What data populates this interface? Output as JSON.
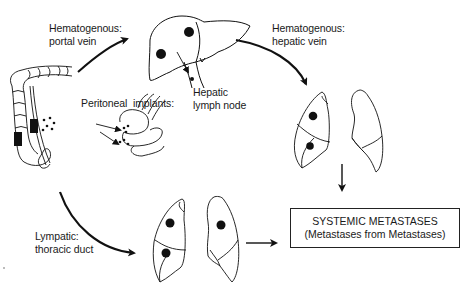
{
  "diagram": {
    "labels": {
      "portal_vein": [
        "Hematogenous:",
        "portal vein"
      ],
      "hepatic_vein": [
        "Hematogenous:",
        "hepatic vein"
      ],
      "peritoneal": "Peritoneal  implants:",
      "lymph_node": [
        "Hepatic",
        "lymph node"
      ],
      "thoracic_duct": [
        "Lympatic:",
        "thoracic duct"
      ]
    },
    "outcome_box": {
      "line1": "SYSTEMIC METASTASES",
      "line2": "(Metastases from Metastases)"
    },
    "nodes": [
      {
        "id": "colon",
        "name": "Primary colon tumor"
      },
      {
        "id": "liver",
        "name": "Liver with metastases",
        "lesions": 2
      },
      {
        "id": "lungs-upper",
        "name": "Lungs (via hepatic vein)",
        "lesions": 2
      },
      {
        "id": "lungs-lower",
        "name": "Lungs (via thoracic duct)",
        "lesions": 3
      },
      {
        "id": "peritoneum",
        "name": "Bowel loops with peritoneal implants"
      }
    ],
    "edges": [
      {
        "from": "colon",
        "to": "liver",
        "label": "Hematogenous: portal vein"
      },
      {
        "from": "liver",
        "to": "lungs-upper",
        "label": "Hematogenous: hepatic vein"
      },
      {
        "from": "colon",
        "to": "lungs-lower",
        "label": "Lympatic: thoracic duct"
      },
      {
        "from": "lungs-upper",
        "to": "systemic",
        "label": ""
      },
      {
        "from": "lungs-lower",
        "to": "systemic",
        "label": ""
      }
    ],
    "colors": {
      "ink": "#111111",
      "background": "#ffffff"
    }
  }
}
